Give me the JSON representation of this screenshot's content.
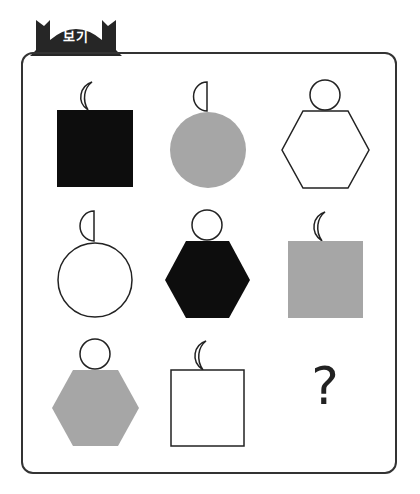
{
  "header": {
    "label": "보기"
  },
  "colors": {
    "black": "#0d0d0d",
    "gray": "#a6a6a6",
    "white": "#ffffff",
    "stroke": "#222222"
  },
  "grid": {
    "rows": 3,
    "cols": 3,
    "cells": [
      {
        "row": 1,
        "col": 1,
        "shape": "square",
        "fill": "black",
        "ornament": "crescent"
      },
      {
        "row": 1,
        "col": 2,
        "shape": "circle",
        "fill": "gray",
        "ornament": "half-circle"
      },
      {
        "row": 1,
        "col": 3,
        "shape": "hexagon",
        "fill": "white",
        "ornament": "circle"
      },
      {
        "row": 2,
        "col": 1,
        "shape": "circle",
        "fill": "white",
        "ornament": "half-circle"
      },
      {
        "row": 2,
        "col": 2,
        "shape": "hexagon",
        "fill": "black",
        "ornament": "circle"
      },
      {
        "row": 2,
        "col": 3,
        "shape": "square",
        "fill": "gray",
        "ornament": "crescent"
      },
      {
        "row": 3,
        "col": 1,
        "shape": "hexagon",
        "fill": "gray",
        "ornament": "circle"
      },
      {
        "row": 3,
        "col": 2,
        "shape": "square",
        "fill": "white",
        "ornament": "crescent"
      },
      {
        "row": 3,
        "col": 3,
        "shape": "unknown",
        "fill": null,
        "ornament": null
      }
    ]
  },
  "answer_placeholder": "?"
}
